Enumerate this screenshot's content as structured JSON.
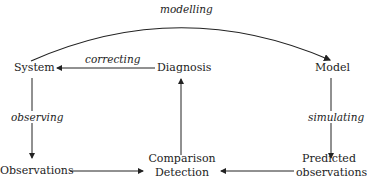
{
  "nodes": {
    "system": "System",
    "diagnosis": "Diagnosis",
    "model": "Model",
    "observations": "Observations",
    "comparison_line1": "Comparison",
    "comparison_line2": "Detection",
    "predicted_line1": "Predicted",
    "predicted_line2": "observations"
  },
  "edges": {
    "modelling": "modelling",
    "correcting": "correcting",
    "observing": "observing",
    "simulating": "simulating"
  },
  "colors": {
    "line": "#222222",
    "background": "#ffffff"
  }
}
